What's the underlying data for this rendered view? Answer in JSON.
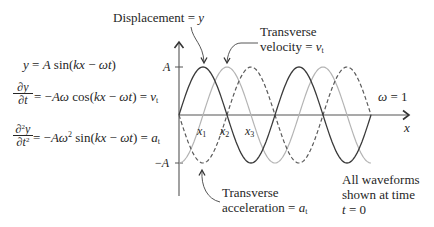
{
  "equations": {
    "displacement": "y = A sin(kx − ωt)",
    "velocity": {
      "numerator": "∂y",
      "denominator": "∂t",
      "rhs": "= −Aω cos(kx − ωt) = v_t"
    },
    "acceleration": {
      "numerator": "∂^2y",
      "denominator": "∂t^2",
      "rhs": "= −Aω^2 sin(kx − ωt) = a_t"
    }
  },
  "axes": {
    "y_tick_positive": "A",
    "y_tick_negative": "−A",
    "x_label": "x",
    "x_markers": [
      "x_1",
      "x_2",
      "x_3"
    ]
  },
  "annotations": {
    "displacement": {
      "label": "Displacement =",
      "symbol": "y"
    },
    "velocity": {
      "line1": "Transverse",
      "label": "velocity =",
      "symbol": "v_t"
    },
    "acceleration": {
      "line1": "Transverse",
      "label": "acceleration =",
      "symbol": "a_t"
    },
    "omega": "ω = 1",
    "note": {
      "line1": "All waveforms",
      "line2": "shown at time",
      "line3": "t = 0"
    }
  },
  "plot": {
    "origin_x": 179,
    "origin_y": 115,
    "amplitude_px": 48,
    "wavelength_px": 96,
    "x_end_px": 371
  },
  "waveforms": [
    {
      "id": "velocity",
      "name": "Transverse velocity",
      "expr_t0": "-A cos(kx)",
      "sin_coef": 0,
      "cos_coef": -1,
      "color": "#b4b4b4",
      "dash": ""
    },
    {
      "id": "acceleration",
      "name": "Transverse acceleration",
      "expr_t0": "-A sin(kx)",
      "sin_coef": -1,
      "cos_coef": 0,
      "color": "#5a5a5a",
      "dash": "4 2.5"
    },
    {
      "id": "displacement",
      "name": "Displacement",
      "expr_t0": "A sin(kx)",
      "sin_coef": 1,
      "cos_coef": 0,
      "color": "#3a3a3a",
      "dash": ""
    }
  ]
}
